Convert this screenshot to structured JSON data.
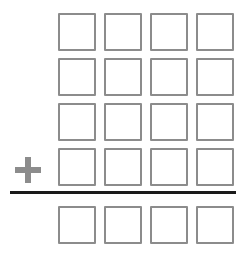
{
  "page": {
    "width": 249,
    "height": 255,
    "background_color": "#ffffff"
  },
  "style": {
    "cell_border_color": "#8c8c8c",
    "cell_fill_color": "#ffffff",
    "cell_border_width": 2,
    "plus_color": "#8c8c8c",
    "rule_color": "#1a1a1a"
  },
  "operator": {
    "symbol": "+",
    "name": "plus-sign",
    "x": 15,
    "y": 157,
    "size": 26
  },
  "rule": {
    "name": "addition-rule-line",
    "x": 10,
    "y": 191,
    "width": 226,
    "height": 3
  },
  "grid": {
    "columns": 4,
    "addend_rows": 4,
    "sum_rows": 1,
    "cell_width": 38,
    "cell_height": 38,
    "column_x": [
      58,
      104,
      150,
      196
    ],
    "addend_row_y": [
      13,
      58,
      103,
      148
    ],
    "sum_row_y": [
      206
    ],
    "cells": {
      "addends": [
        [
          "",
          "",
          "",
          ""
        ],
        [
          "",
          "",
          "",
          ""
        ],
        [
          "",
          "",
          "",
          ""
        ],
        [
          "",
          "",
          "",
          ""
        ]
      ],
      "sum": [
        [
          "",
          "",
          "",
          ""
        ]
      ]
    }
  }
}
